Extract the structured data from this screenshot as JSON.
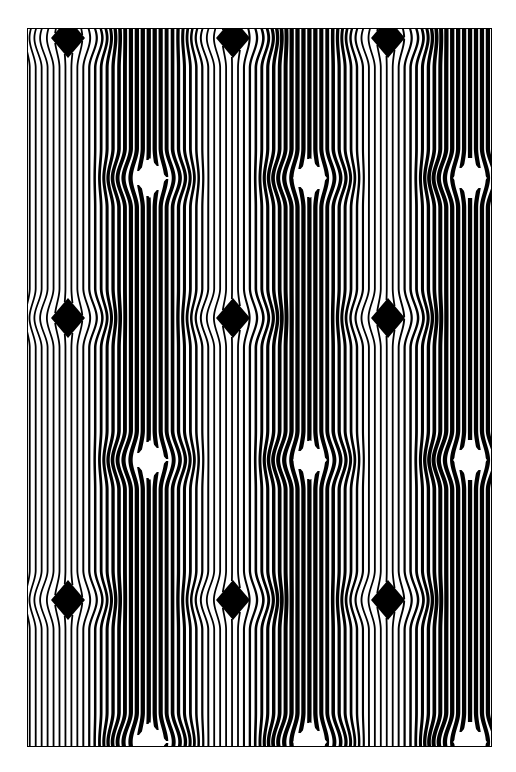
{
  "artwork": {
    "title": "Vertical Line Op-Art Illusion",
    "medium": "black-and-white line pattern",
    "type": "optical-illusion-pattern",
    "canvas": {
      "image_width": 516,
      "image_height": 772,
      "background_color": "#ffffff",
      "ink_color": "#000000"
    },
    "plate": {
      "left": 27,
      "top": 28,
      "right": 492,
      "bottom": 747,
      "width": 465,
      "height": 719,
      "border_color": "#000000",
      "border_width": 1
    },
    "stripes": {
      "orientation": "vertical",
      "period_px": 5.95,
      "count": 78,
      "line_color": "#000000",
      "gap_color": "#ffffff",
      "description": "Evenly spaced vertical lines whose thickness alternates column by column, bending around diamond nodes."
    },
    "columns": {
      "count": 6,
      "boundaries_px": [
        27,
        107,
        185,
        265,
        344,
        422,
        492
      ],
      "phase_sequence": [
        "light",
        "dark",
        "light",
        "dark",
        "light",
        "dark"
      ],
      "light_duty": 0.3,
      "dark_duty": 0.72,
      "description": "Alternating wide-line (dark) and thin-line (light) vertical bands create broad tonal columns."
    },
    "nodes": {
      "shape": "diamond",
      "radius_x": 17,
      "radius_y": 20,
      "deflection_radius_x": 62,
      "deflection_radius_y": 30,
      "black_nodes": {
        "fill": "#000000",
        "sits_on": "light column",
        "columns_x": [
          68,
          233,
          388
        ],
        "rows_y": [
          38,
          318,
          600
        ]
      },
      "white_nodes": {
        "fill": "#ffffff",
        "sits_on": "dark column",
        "columns_x": [
          150,
          310,
          470
        ],
        "rows_y": [
          178,
          460,
          742
        ]
      },
      "row_spacing_px": 281,
      "row_offset_px": 140,
      "description": "Diamond nodes alternate black-on-light and white-on-dark in a staggered lattice; adjacent lines splay outward forming chevron arrowheads pointing at each node."
    },
    "palette": {
      "ink": "#000000",
      "paper": "#ffffff"
    }
  }
}
